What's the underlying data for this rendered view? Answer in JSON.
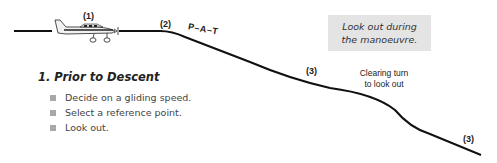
{
  "diagram": {
    "labels": {
      "step1": "(1)",
      "step2": "(2)",
      "step3a": "(3)",
      "step3b": "(3)",
      "pat": "P–A–T"
    },
    "note": {
      "line1": "Look out during",
      "line2": "the manoeuvre."
    },
    "clearing_turn": {
      "line1": "Clearing turn",
      "line2": "to look out"
    },
    "section": {
      "heading": "1.  Prior to Descent",
      "items": [
        {
          "icon": "square-bullet",
          "text": "Decide on a gliding speed."
        },
        {
          "icon": "square-bullet",
          "text": "Select a reference point."
        },
        {
          "icon": "square-bullet",
          "text": "Look out."
        }
      ]
    },
    "colors": {
      "line": "#111111",
      "note_bg": "#e4e4e4",
      "bullet": "#a8a8a8"
    }
  }
}
